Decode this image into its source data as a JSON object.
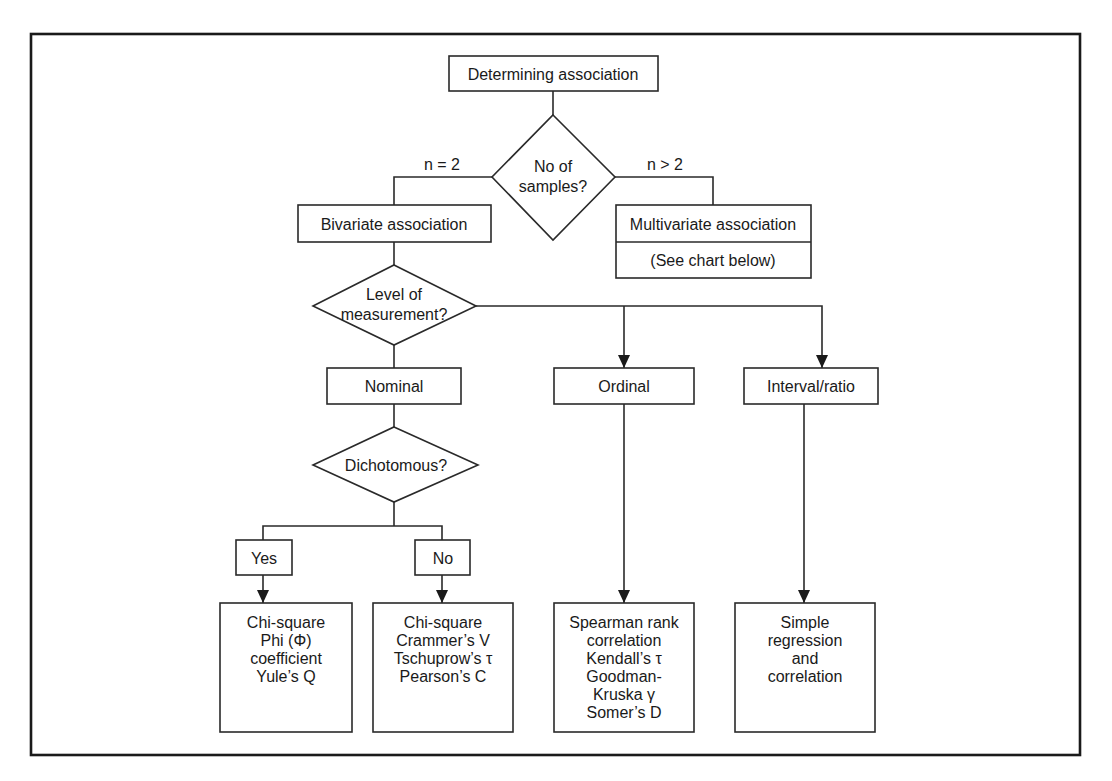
{
  "diagram": {
    "root": {
      "label": "Determining association"
    },
    "samples_decision": {
      "lines": [
        "No of",
        "samples?"
      ]
    },
    "branch_labels": {
      "left": "n = 2",
      "right": "n > 2"
    },
    "bivariate": {
      "label": "Bivariate association"
    },
    "multivariate": {
      "label": "Multivariate association",
      "note": "(See chart below)"
    },
    "measurement_decision": {
      "lines": [
        "Level of",
        "measurement?"
      ]
    },
    "levels": {
      "nominal": "Nominal",
      "ordinal": "Ordinal",
      "interval": "Interval/ratio"
    },
    "dichotomous_decision": {
      "label": "Dichotomous?"
    },
    "answers": {
      "yes": "Yes",
      "no": "No"
    },
    "results": {
      "yes": [
        "Chi-square",
        "Phi (Φ)",
        "coefficient",
        "Yule’s Q"
      ],
      "no": [
        "Chi-square",
        "Crammer’s V",
        "Tschuprow’s τ",
        "Pearson’s C"
      ],
      "ordinal": [
        "Spearman rank",
        "correlation",
        "Kendall’s τ",
        "Goodman-",
        "Kruska γ",
        "Somer’s D"
      ],
      "interval": [
        "Simple",
        "regression",
        "and",
        "correlation"
      ]
    }
  }
}
